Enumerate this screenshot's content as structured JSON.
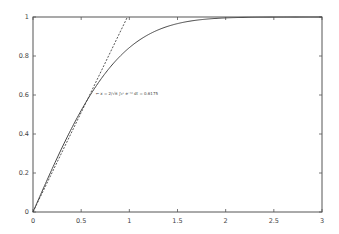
{
  "chart_data": {
    "type": "line",
    "title": "",
    "xlabel": "",
    "ylabel": "",
    "xlim": [
      0,
      3
    ],
    "ylim": [
      0,
      1
    ],
    "grid": false,
    "legend": null,
    "x_ticks": [
      "0",
      "0.5",
      "1",
      "1.5",
      "2",
      "2.5",
      "3"
    ],
    "y_ticks": [
      "0",
      "0.2",
      "0.4",
      "0.6",
      "0.8",
      "1"
    ],
    "series": [
      {
        "name": "erf(x)",
        "style": "solid",
        "x": [
          0,
          0.1,
          0.2,
          0.3,
          0.4,
          0.5,
          0.6,
          0.7,
          0.8,
          0.9,
          1.0,
          1.2,
          1.4,
          1.6,
          1.8,
          2.0,
          2.2,
          2.5,
          3.0
        ],
        "y": [
          0,
          0.1125,
          0.2227,
          0.3286,
          0.4284,
          0.5205,
          0.6039,
          0.6778,
          0.7421,
          0.7969,
          0.8427,
          0.9103,
          0.9523,
          0.9763,
          0.9891,
          0.9953,
          0.9981,
          0.9996,
          1.0
        ]
      },
      {
        "name": "tangent line",
        "style": "dashed",
        "x": [
          0,
          0.98
        ],
        "y": [
          0,
          1.0
        ]
      }
    ],
    "annotations": [
      {
        "text": "← x = 2/√π ∫₀ˣ e^(−t²) dt = 0.6175",
        "x": 0.64,
        "y": 0.61
      }
    ]
  },
  "annotation_text": "← x = 2/√π ∫₀ˣ e⁻ᵗ² dt = 0.6175"
}
